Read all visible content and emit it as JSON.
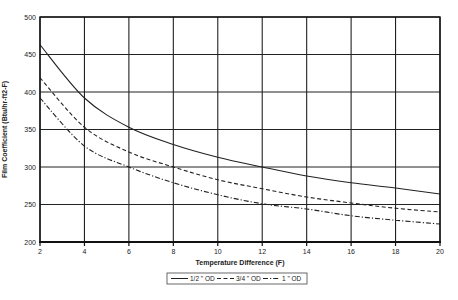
{
  "chart_data": {
    "type": "line",
    "title": "",
    "xlabel": "Temperature Difference (F)",
    "ylabel": "Film Coefficient (Btu/hr-ft2-F)",
    "xlim": [
      2,
      20
    ],
    "ylim": [
      200,
      500
    ],
    "xticks": [
      2,
      4,
      6,
      8,
      10,
      12,
      14,
      16,
      18,
      20
    ],
    "yticks": [
      200,
      250,
      300,
      350,
      400,
      450,
      500
    ],
    "grid": true,
    "legend_position": "bottom-center",
    "x": [
      2,
      4,
      6,
      8,
      10,
      12,
      14,
      16,
      18,
      20
    ],
    "series": [
      {
        "name": "1/2 \" OD",
        "style": "solid",
        "values": [
          463,
          392,
          353,
          330,
          313,
          300,
          288,
          279,
          272,
          264
        ]
      },
      {
        "name": "3/4 \" OD",
        "style": "dashed",
        "values": [
          419,
          353,
          320,
          300,
          283,
          271,
          260,
          252,
          245,
          240
        ]
      },
      {
        "name": "1 \" OD",
        "style": "dash-dot",
        "values": [
          392,
          328,
          300,
          279,
          263,
          251,
          244,
          235,
          229,
          224
        ]
      }
    ]
  }
}
